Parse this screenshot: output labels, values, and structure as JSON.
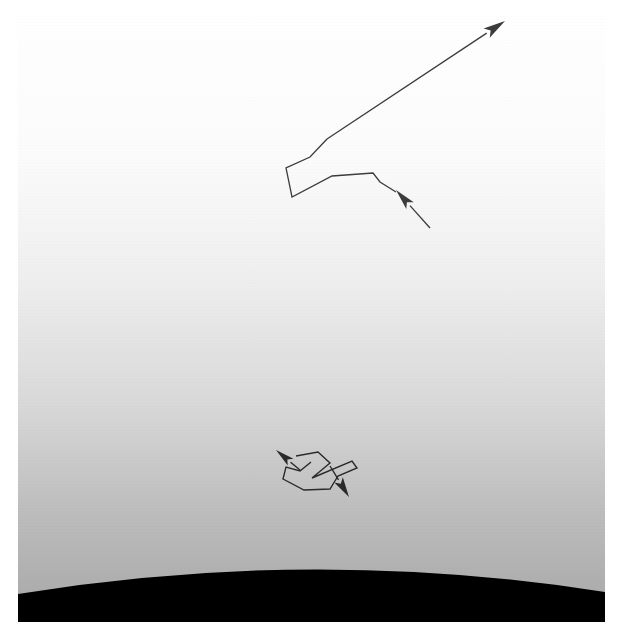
{
  "figure": {
    "title": "",
    "width": 618,
    "height": 632,
    "page_background": "#ffffff",
    "content_rect": {
      "x": 18,
      "y": 2,
      "width": 587,
      "height": 620
    }
  },
  "sky": {
    "label": "atmosphere-gradient",
    "top_color": "#ffffff",
    "bottom_color": "#a7a7a7",
    "gradient_stops": [
      {
        "offset": 0.0,
        "color": "#ffffff"
      },
      {
        "offset": 0.25,
        "color": "#fbfbfb"
      },
      {
        "offset": 0.45,
        "color": "#eeeeee"
      },
      {
        "offset": 0.65,
        "color": "#d8d8d8"
      },
      {
        "offset": 0.82,
        "color": "#bdbdbd"
      },
      {
        "offset": 1.0,
        "color": "#a7a7a7"
      }
    ]
  },
  "horizon": {
    "label": "planet-limb",
    "color": "#000000",
    "apex_x": 312,
    "apex_y": 560,
    "left_edge_y": 592,
    "right_edge_y": 592,
    "curve": "M 18 594 Q 312 546 605 592 L 605 622 L 18 622 Z"
  },
  "tracks": [
    {
      "name": "upper-trajectory",
      "stroke": "#3c3c3c",
      "stroke_width": 1.3,
      "polyline": "327,139 310,157 286,168 292,197 332,176 373,173 380,182 396,192",
      "scatter_node": "332,176",
      "arrows": [
        {
          "name": "upper-outgoing-arrow",
          "tail_x": 327,
          "tail_y": 139,
          "tip_x": 505,
          "tip_y": 21,
          "head_length": 22,
          "head_width": 11
        },
        {
          "name": "upper-incoming-arrow",
          "tail_x": 430,
          "tail_y": 228,
          "tip_x": 396,
          "tip_y": 190,
          "head_length": 21,
          "head_width": 10
        }
      ]
    },
    {
      "name": "lower-trajectory",
      "stroke": "#2a2a2a",
      "stroke_width": 1.4,
      "polyline": "296,456 318,452 330,463 312,478 352,461 357,468 338,476 330,489 304,490 283,479 286,467 300,471 311,462",
      "arrows": [
        {
          "name": "lower-incoming-arrow",
          "tail_x": 300,
          "tail_y": 470,
          "tip_x": 276,
          "tip_y": 450,
          "head_length": 19,
          "head_width": 9
        },
        {
          "name": "lower-outgoing-arrow",
          "tail_x": 330,
          "tail_y": 466,
          "tip_x": 349,
          "tip_y": 497,
          "head_length": 20,
          "head_width": 10
        }
      ]
    }
  ]
}
